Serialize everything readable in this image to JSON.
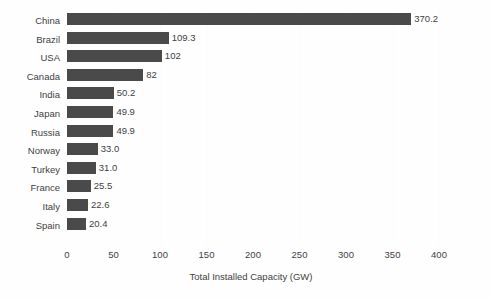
{
  "chart_data": {
    "type": "bar",
    "orientation": "horizontal",
    "title": "",
    "xlabel": "Total Installed Capacity (GW)",
    "ylabel": "",
    "xlim": [
      0,
      400
    ],
    "xticks": [
      0,
      50,
      100,
      150,
      200,
      250,
      300,
      350,
      400
    ],
    "xtick_labels": [
      "0",
      "50",
      "100",
      "150",
      "200",
      "250",
      "300",
      "350",
      "400"
    ],
    "grid": false,
    "legend": null,
    "bar_color": "#4a4a4a",
    "categories": [
      "China",
      "Brazil",
      "USA",
      "Canada",
      "India",
      "Japan",
      "Russia",
      "Norway",
      "Turkey",
      "France",
      "Italy",
      "Spain"
    ],
    "values": [
      370.2,
      109.3,
      102,
      82,
      50.2,
      49.9,
      49.9,
      33.0,
      31.0,
      25.5,
      22.6,
      20.4
    ],
    "value_labels": [
      "370.2",
      "109.3",
      "102",
      "82",
      "50.2",
      "49.9",
      "49.9",
      "33.0",
      "31.0",
      "25.5",
      "22.6",
      "20.4"
    ]
  }
}
